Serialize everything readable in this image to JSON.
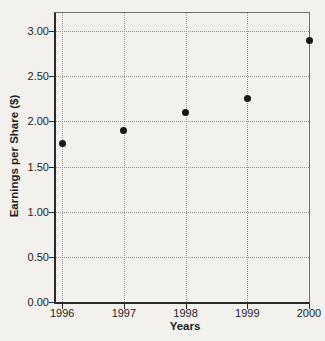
{
  "figure": {
    "background": "#f2f1ee",
    "axis_color": "#2a2a2a",
    "frame_border_color": "#6e6e6e",
    "grid_color": "#979792",
    "point_color": "#161616",
    "text_color": "#1d1d1d"
  },
  "chart_data": {
    "type": "scatter",
    "title": "",
    "xlabel": "Years",
    "ylabel": "Earnings per Share ($)",
    "x": [
      1996,
      1997,
      1998,
      1999,
      2000
    ],
    "values": [
      1.75,
      1.9,
      2.1,
      2.25,
      2.9
    ],
    "series_name": "Earnings per Share",
    "xlim": [
      1995.9,
      2000
    ],
    "ylim": [
      0,
      3.2
    ],
    "x_ticks": [
      {
        "value": 1996,
        "label": "1996"
      },
      {
        "value": 1997,
        "label": "1997"
      },
      {
        "value": 1998,
        "label": "1998"
      },
      {
        "value": 1999,
        "label": "1999"
      },
      {
        "value": 2000,
        "label": "2000"
      }
    ],
    "y_ticks": [
      {
        "value": 0.0,
        "label": "0.00"
      },
      {
        "value": 0.5,
        "label": "0.50"
      },
      {
        "value": 1.0,
        "label": "1.00"
      },
      {
        "value": 1.5,
        "label": "1.50"
      },
      {
        "value": 2.0,
        "label": "2.00"
      },
      {
        "value": 2.5,
        "label": "2.50"
      },
      {
        "value": 3.0,
        "label": "3.00"
      }
    ],
    "grid": "dotted",
    "legend": "none",
    "marker": "filled-circle"
  }
}
